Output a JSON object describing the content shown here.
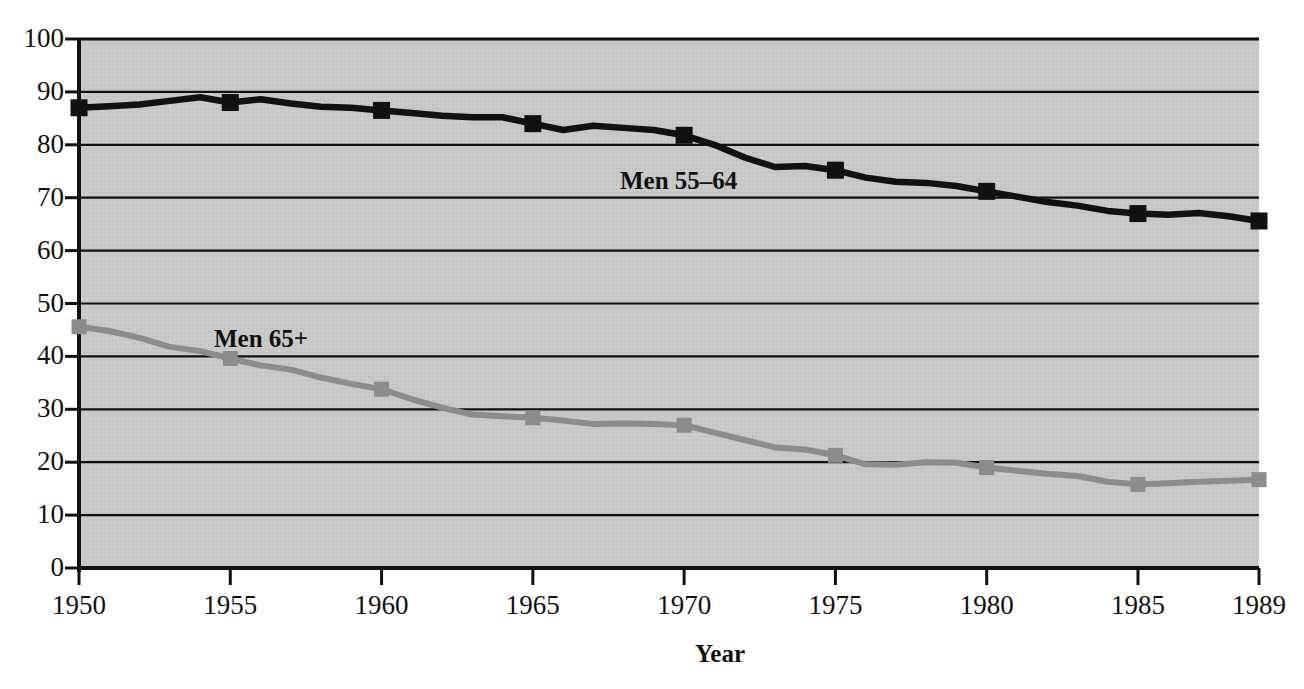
{
  "chart_data": {
    "type": "line",
    "title": "",
    "subtitle": "",
    "xlabel": "Year",
    "ylabel": "",
    "xlim": [
      1950,
      1989
    ],
    "ylim": [
      0,
      100
    ],
    "grid": true,
    "legend_position": "inline-annotation",
    "x_ticks": [
      "1950",
      "1955",
      "1960",
      "1965",
      "1970",
      "1975",
      "1980",
      "1985",
      "1989"
    ],
    "x_tick_values": [
      1950,
      1955,
      1960,
      1965,
      1970,
      1975,
      1980,
      1985,
      1989
    ],
    "y_ticks": [
      "0",
      "10",
      "20",
      "30",
      "40",
      "50",
      "60",
      "70",
      "80",
      "90",
      "100"
    ],
    "y_tick_values": [
      0,
      10,
      20,
      30,
      40,
      50,
      60,
      70,
      80,
      90,
      100
    ],
    "x": [
      1950,
      1951,
      1952,
      1953,
      1954,
      1955,
      1956,
      1957,
      1958,
      1959,
      1960,
      1961,
      1962,
      1963,
      1964,
      1965,
      1966,
      1967,
      1968,
      1969,
      1970,
      1971,
      1972,
      1973,
      1974,
      1975,
      1976,
      1977,
      1978,
      1979,
      1980,
      1981,
      1982,
      1983,
      1984,
      1985,
      1986,
      1987,
      1988,
      1989
    ],
    "series": [
      {
        "name": "Men 55-64",
        "label": "Men 55–64",
        "color": "#111111",
        "marker": "square",
        "marker_years": [
          1950,
          1955,
          1960,
          1965,
          1970,
          1975,
          1980,
          1985,
          1989
        ],
        "values": [
          87.0,
          87.3,
          87.6,
          88.3,
          89.0,
          88.0,
          88.6,
          87.8,
          87.2,
          87.0,
          86.5,
          86.0,
          85.5,
          85.2,
          85.2,
          84.0,
          82.8,
          83.6,
          83.2,
          82.8,
          81.8,
          80.0,
          77.6,
          75.8,
          76.0,
          75.2,
          73.8,
          73.0,
          72.8,
          72.2,
          71.2,
          70.2,
          69.2,
          68.5,
          67.5,
          67.0,
          66.8,
          67.1,
          66.5,
          65.6
        ]
      },
      {
        "name": "Men 65+",
        "label": "Men 65+",
        "color": "#8c8c8c",
        "marker": "square",
        "marker_years": [
          1950,
          1955,
          1960,
          1965,
          1970,
          1975,
          1980,
          1985,
          1989
        ],
        "values": [
          45.6,
          44.8,
          43.5,
          41.8,
          41.0,
          39.6,
          38.3,
          37.5,
          36.0,
          34.8,
          33.8,
          31.9,
          30.3,
          29.0,
          28.7,
          28.4,
          27.9,
          27.2,
          27.3,
          27.2,
          27.0,
          25.6,
          24.2,
          22.8,
          22.4,
          21.3,
          19.6,
          19.5,
          20.0,
          19.9,
          19.0,
          18.4,
          17.8,
          17.4,
          16.3,
          15.8,
          16.0,
          16.3,
          16.5,
          16.7
        ]
      }
    ],
    "annotations": [
      {
        "text": "Men 55–64",
        "x_px": 620,
        "y_px": 167
      },
      {
        "text": "Men 65+",
        "x_px": 214,
        "y_px": 325
      }
    ]
  },
  "axis": {
    "x_title": "Year"
  },
  "style": {
    "plot_background": "#c9c9c9",
    "axis_color": "#111111",
    "gridline_color": "#111111",
    "series1_color": "#111111",
    "series2_color": "#8c8c8c"
  }
}
